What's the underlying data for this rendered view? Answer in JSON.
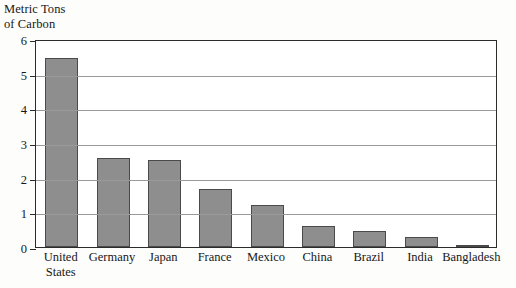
{
  "chart_data": {
    "type": "bar",
    "title": "Metric Tons\nof Carbon",
    "ylabel": "Metric Tons of Carbon",
    "xlabel": "",
    "categories": [
      "United\nStates",
      "Germany",
      "Japan",
      "France",
      "Mexico",
      "China",
      "Brazil",
      "India",
      "Bangladesh"
    ],
    "values": [
      5.45,
      2.58,
      2.52,
      1.68,
      1.2,
      0.6,
      0.47,
      0.28,
      0.06
    ],
    "ylim": [
      0,
      6
    ],
    "yticks": [
      0,
      1,
      2,
      3,
      4,
      5,
      6
    ],
    "ytick_labels": [
      "0",
      "1",
      "2",
      "3",
      "4",
      "5",
      "6"
    ],
    "grid": true,
    "legend": false,
    "bar_color": "#8e8e8e",
    "bar_edge_color": "#4a4a4a",
    "grid_color": "#9a9a9a",
    "frame_color": "#2b2b2b",
    "background_color": "#fdfdfb"
  }
}
